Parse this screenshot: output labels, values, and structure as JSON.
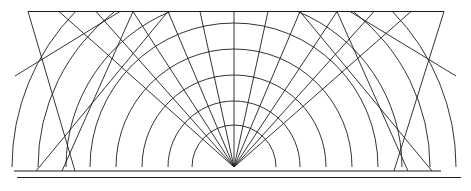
{
  "figure": {
    "width": 471,
    "height": 191,
    "background_color": "#ffffff",
    "stroke_color": "#1d1d1d"
  },
  "chart_data": {
    "type": "line",
    "xlabel": "",
    "ylabel": "",
    "grid": false,
    "legend": "none",
    "xlim": [
      0,
      471
    ],
    "ylim": [
      0,
      191
    ],
    "focus_point": {
      "x": 234,
      "y": 167
    },
    "top_edge": {
      "x1": 28,
      "y1": 11.5,
      "x2": 444,
      "y2": 11.5
    },
    "baselines": [
      {
        "name": "baseline-upper",
        "x1": 14,
        "y1": 171,
        "x2": 441,
        "y2": 171
      },
      {
        "name": "baseline-lower",
        "x1": 17,
        "y1": 177.5,
        "x2": 461,
        "y2": 177.5
      }
    ],
    "arcs": {
      "center": {
        "x": 234,
        "y": 167
      },
      "radii": [
        42,
        66,
        92,
        118,
        144,
        168,
        196,
        222
      ],
      "arc_span_degrees": 180
    },
    "rays": {
      "origin": {
        "x": 234,
        "y": 167
      },
      "angles_degrees": [
        -76,
        -66,
        -56,
        -46,
        -36,
        -26,
        -16,
        -8,
        0,
        8,
        16,
        26,
        36,
        46,
        56,
        66,
        76
      ],
      "endpoints_on_top_x": [
        59,
        96,
        133,
        168,
        200,
        234,
        268,
        300,
        337,
        374,
        411
      ]
    },
    "diagonals": [
      {
        "name": "left-outer-down",
        "x1": 28,
        "y1": 11.5,
        "x2": 75,
        "y2": 171
      },
      {
        "name": "left-outer-up",
        "x1": 15,
        "y1": 76,
        "x2": 120,
        "y2": 11.5
      },
      {
        "name": "right-outer-down",
        "x1": 444,
        "y1": 11.5,
        "x2": 394,
        "y2": 171
      },
      {
        "name": "right-outer-up",
        "x1": 456,
        "y1": 76,
        "x2": 350,
        "y2": 11.5
      }
    ],
    "series": [
      {
        "name": "concentric-arcs",
        "count": 8
      },
      {
        "name": "radial-rays",
        "count": 17
      },
      {
        "name": "cross-diagonals",
        "count": 8
      },
      {
        "name": "horizontal-baselines",
        "count": 2
      },
      {
        "name": "top-edge",
        "count": 1
      }
    ]
  }
}
